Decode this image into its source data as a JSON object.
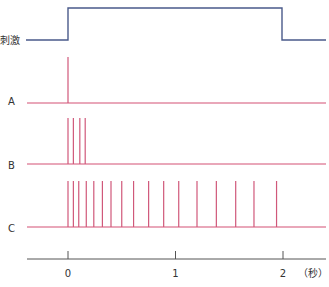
{
  "labels": {
    "stimulus": "刺激",
    "rowA": "A",
    "rowB": "B",
    "rowC": "C",
    "tick0": "0",
    "tick1": "1",
    "tick2": "2",
    "unit": "（秒）"
  },
  "colors": {
    "stimulus": "#4a5a8a",
    "spike": "#d0587a",
    "baseline": "#e28aa2",
    "axis": "#555555"
  },
  "chart_data": {
    "type": "line",
    "title": "",
    "xlabel": "（秒）",
    "ylabel": "",
    "xlim": [
      -0.38,
      2.4
    ],
    "x_ticks": [
      0,
      1,
      2
    ],
    "grid": false,
    "stimulus": {
      "name": "刺激",
      "onset_s": 0,
      "offset_s": 2,
      "shape": "step"
    },
    "series": [
      {
        "name": "A",
        "spike_times_s": [
          0.0
        ]
      },
      {
        "name": "B",
        "spike_times_s": [
          0.0,
          0.05,
          0.11,
          0.16
        ]
      },
      {
        "name": "C",
        "spike_times_s": [
          0.0,
          0.05,
          0.1,
          0.17,
          0.24,
          0.32,
          0.4,
          0.5,
          0.61,
          0.75,
          0.89,
          1.03,
          1.2,
          1.38,
          1.56,
          1.73,
          1.94
        ]
      }
    ]
  }
}
